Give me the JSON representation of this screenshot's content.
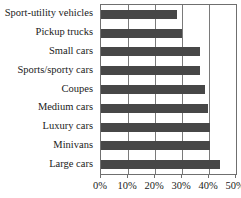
{
  "chart_data": {
    "type": "bar",
    "orientation": "horizontal",
    "title": "",
    "subtitle": "",
    "xlabel": "",
    "ylabel": "",
    "xlim": [
      0,
      50
    ],
    "ylim": null,
    "grid": true,
    "grid_axis": "x",
    "legend": null,
    "legend_position": "none",
    "bar_color": "#474747",
    "axis_color": "#6f6f6f",
    "text_color": "#1a1a1a",
    "tick_labels": [
      "0%",
      "10%",
      "20%",
      "30%",
      "40%",
      "50%"
    ],
    "tick_values": [
      0,
      10,
      20,
      30,
      40,
      50
    ],
    "categories": [
      "Sport-utility vehicles",
      "Pickup trucks",
      "Small cars",
      "Sports/sporty cars",
      "Coupes",
      "Medium cars",
      "Luxury cars",
      "Minivans",
      "Large cars"
    ],
    "values": [
      28,
      30,
      36.5,
      36.5,
      38.5,
      39.5,
      40.5,
      40.5,
      44
    ],
    "value_labels": [
      "28%",
      "30%",
      "36.5%",
      "36.5%",
      "38.5%",
      "39.5%",
      "40.5%",
      "40.5%",
      "44%"
    ],
    "series": [
      {
        "name": "",
        "values": [
          28,
          30,
          36.5,
          36.5,
          38.5,
          39.5,
          40.5,
          40.5,
          44
        ]
      }
    ],
    "annotations": []
  }
}
